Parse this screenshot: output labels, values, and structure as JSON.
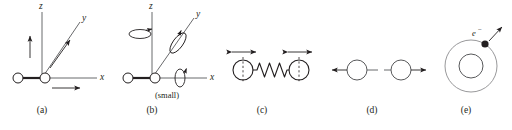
{
  "figure": {
    "background_color": "#ffffff",
    "ink_color": "#231f20",
    "line_color": "#58595b"
  },
  "panels": [
    {
      "id": "a",
      "caption": "(a)",
      "caption_x": 42,
      "caption_y": 108,
      "type": "translation-axes",
      "description": "diatomic molecule at origin with x, y, z axes and translation arrows",
      "axis_labels": {
        "x": "x",
        "y": "y",
        "z": "z"
      }
    },
    {
      "id": "b",
      "caption": "(b)",
      "caption_x": 152,
      "caption_y": 108,
      "type": "rotation-axes",
      "description": "diatomic molecule at origin with rotation arrows about x, y, z axes",
      "axis_labels": {
        "x": "x",
        "y": "y",
        "z": "z"
      },
      "note": "(small)",
      "note_x": 167,
      "note_y": 98
    },
    {
      "id": "c",
      "caption": "(c)",
      "caption_x": 262,
      "caption_y": 108,
      "type": "vibration-spring",
      "description": "two atoms joined by a spring with double-headed vibration arrows"
    },
    {
      "id": "d",
      "caption": "(d)",
      "caption_x": 372,
      "caption_y": 108,
      "type": "atom-translation",
      "description": "two atoms each with a single translation arrow"
    },
    {
      "id": "e",
      "caption": "(e)",
      "caption_x": 466,
      "caption_y": 108,
      "type": "electron-orbit",
      "description": "nucleus with orbiting electron and velocity arrow",
      "electron_label": "e",
      "electron_charge": "−"
    }
  ]
}
